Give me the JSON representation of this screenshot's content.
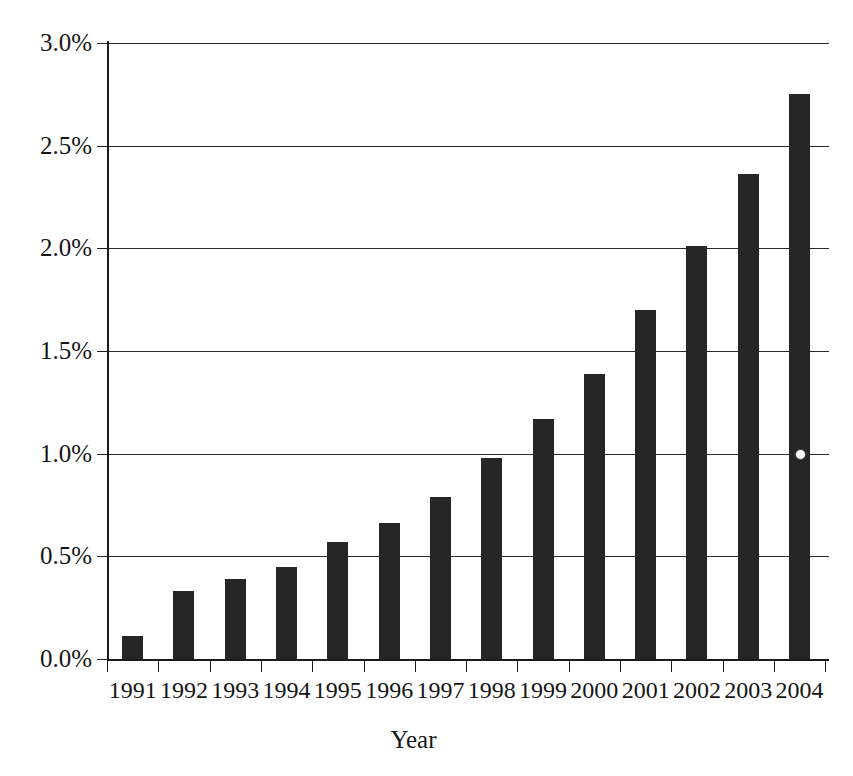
{
  "chart_data": {
    "type": "bar",
    "title": "",
    "subtitle": "",
    "xlabel": "Year",
    "ylabel": "",
    "categories": [
      "1991",
      "1992",
      "1993",
      "1994",
      "1995",
      "1996",
      "1997",
      "1998",
      "1999",
      "2000",
      "2001",
      "2002",
      "2003",
      "2004"
    ],
    "values": [
      0.11,
      0.33,
      0.39,
      0.45,
      0.57,
      0.66,
      0.79,
      0.98,
      1.17,
      1.39,
      1.7,
      2.01,
      2.36,
      2.75
    ],
    "value_labels": [
      "0.11%",
      "0.33%",
      "0.39%",
      "0.45%",
      "0.57%",
      "0.66%",
      "0.79%",
      "0.98%",
      "1.17%",
      "1.39%",
      "1.70%",
      "2.01%",
      "2.36%",
      "2.75%"
    ],
    "ylim": [
      0.0,
      3.0
    ],
    "ytick_values": [
      0.0,
      0.5,
      1.0,
      1.5,
      2.0,
      2.5,
      3.0
    ],
    "ytick_labels": [
      "0.0%",
      "0.5%",
      "1.0%",
      "1.5%",
      "2.0%",
      "2.5%",
      "3.0%"
    ],
    "grid": "horizontal",
    "legend": "none",
    "bar_color": "#262626",
    "axis_color": "#1b1b1b",
    "background_color": "#ffffff",
    "units": "percent"
  },
  "axes": {
    "x_title": "Year",
    "y_title": ""
  },
  "artifacts": [
    {
      "name": "scan-speck",
      "x_pct_value": 2.0,
      "y_value": 1.0
    }
  ]
}
